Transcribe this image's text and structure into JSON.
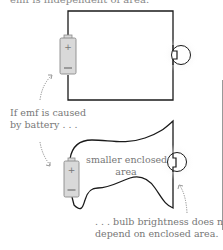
{
  "diagram": {
    "top_text_fragment": "emf is independent of area.",
    "top_circuit": {
      "battery": {
        "plus_symbol": "+",
        "minus_symbol": "−"
      },
      "bulb": "light-bulb",
      "shape": "rectangle"
    },
    "bottom_circuit": {
      "battery": {
        "plus_symbol": "+",
        "minus_symbol": "−"
      },
      "bulb": "light-bulb",
      "shape": "wavy-loop",
      "enclosed_area_label_line1": "smaller enclosed",
      "enclosed_area_label_line2": "area"
    },
    "annotation_left_line1": "If emf is caused",
    "annotation_left_line2": "by battery . . .",
    "annotation_right_line1": ". . . bulb brightness does not",
    "annotation_right_line2": "depend on enclosed area.",
    "colors": {
      "wire": "#1a1a1a",
      "battery_fill": "#d9d9d9",
      "battery_stroke": "#8a8a8a",
      "text": "#6b6b6b",
      "arrow": "#8a8a8a"
    }
  }
}
